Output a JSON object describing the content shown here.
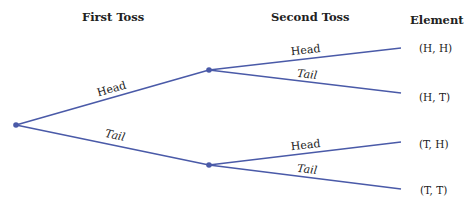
{
  "headers": {
    "first_toss": "First Toss",
    "second_toss": "Second Toss",
    "element": "Element"
  },
  "first_level": [
    {
      "label": "Head"
    },
    {
      "label": "Tail"
    }
  ],
  "second_level": [
    {
      "label": "Head"
    },
    {
      "label": "Tail"
    },
    {
      "label": "Head"
    },
    {
      "label": "Tail"
    }
  ],
  "elements": [
    "(H, H)",
    "(H, T)",
    "(T, H)",
    "(T, T)"
  ],
  "colors": {
    "line": "#4a5aa8",
    "text": "#222222"
  }
}
